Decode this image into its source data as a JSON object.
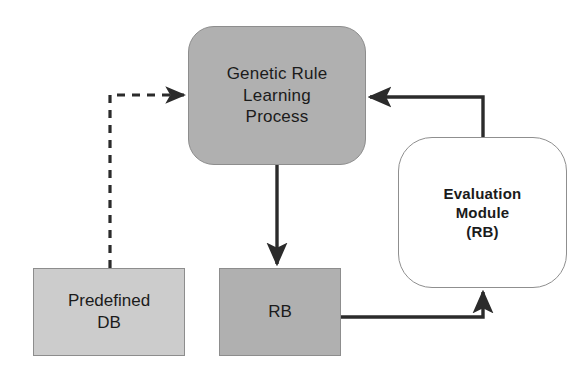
{
  "diagram": {
    "background_color": "#ffffff",
    "nodes": {
      "genetic_rule": {
        "label": "Genetic Rule\nLearning\nProcess",
        "shape": "rounded-rectangle",
        "fill_color": "#b0b0b0",
        "border_color": "#8d8d8d"
      },
      "evaluation_module": {
        "label": "Evaluation\nModule\n(RB)",
        "shape": "rounded-rectangle",
        "fill_color": "#ffffff",
        "border_color": "#8f8f8f"
      },
      "predefined_db": {
        "label": "Predefined\nDB",
        "shape": "rectangle",
        "fill_color": "#cccccc",
        "border_color": "#8d8d8d"
      },
      "rb": {
        "label": "RB",
        "shape": "rectangle",
        "fill_color": "#b0b0b0",
        "border_color": "#8d8d8d"
      }
    },
    "edges": [
      {
        "id": "predefined-db-to-genetic-rule",
        "from": "predefined_db",
        "to": "genetic_rule",
        "style": "dashed",
        "arrowhead": "end",
        "color": "#2b2b2b"
      },
      {
        "id": "genetic-rule-to-rb",
        "from": "genetic_rule",
        "to": "rb",
        "style": "solid",
        "arrowhead": "end",
        "color": "#2b2b2b"
      },
      {
        "id": "rb-to-evaluation-module",
        "from": "rb",
        "to": "evaluation_module",
        "style": "solid",
        "arrowhead": "end",
        "color": "#2b2b2b"
      },
      {
        "id": "evaluation-module-to-genetic-rule",
        "from": "evaluation_module",
        "to": "genetic_rule",
        "style": "solid",
        "arrowhead": "end",
        "color": "#2b2b2b"
      }
    ]
  }
}
